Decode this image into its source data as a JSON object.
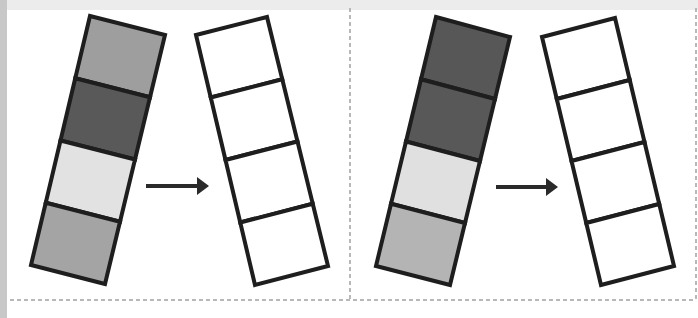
{
  "colors": {
    "background": "#ffffff",
    "outline": "#1e1e1e",
    "border_dash": "#b8b8b8",
    "top_band": "#ececec",
    "left_band": "#c8c8c8",
    "arrow": "#2a2a2a"
  },
  "panels": [
    {
      "name": "panel-left",
      "source_strip": {
        "corners": {
          "tl": [
            90,
            16
          ],
          "tr": [
            165,
            35
          ],
          "br": [
            105,
            284
          ],
          "bl": [
            31,
            265
          ]
        },
        "cells": [
          {
            "fill": "#9e9e9e",
            "label": "medium-gray"
          },
          {
            "fill": "#595959",
            "label": "dark-gray"
          },
          {
            "fill": "#e2e2e2",
            "label": "light-gray"
          },
          {
            "fill": "#a4a4a4",
            "label": "medium-gray"
          }
        ]
      },
      "arrow": {
        "x1": 146,
        "x2": 209,
        "y": 186
      },
      "target_strip": {
        "corners": {
          "tl": [
            196,
            35
          ],
          "tr": [
            267,
            17
          ],
          "br": [
            328,
            266
          ],
          "bl": [
            255,
            285
          ]
        },
        "cells": [
          {
            "fill": "#ffffff",
            "label": "empty"
          },
          {
            "fill": "#ffffff",
            "label": "empty"
          },
          {
            "fill": "#ffffff",
            "label": "empty"
          },
          {
            "fill": "#ffffff",
            "label": "empty"
          }
        ]
      }
    },
    {
      "name": "panel-right",
      "source_strip": {
        "corners": {
          "tl": [
            436,
            17
          ],
          "tr": [
            510,
            37
          ],
          "br": [
            450,
            285
          ],
          "bl": [
            376,
            266
          ]
        },
        "cells": [
          {
            "fill": "#575757",
            "label": "dark-gray"
          },
          {
            "fill": "#585858",
            "label": "dark-gray"
          },
          {
            "fill": "#e0e0e0",
            "label": "light-gray"
          },
          {
            "fill": "#b4b4b4",
            "label": "medium-light-gray"
          }
        ]
      },
      "arrow": {
        "x1": 496,
        "x2": 558,
        "y": 187
      },
      "target_strip": {
        "corners": {
          "tl": [
            542,
            37
          ],
          "tr": [
            615,
            18
          ],
          "br": [
            674,
            266
          ],
          "bl": [
            601,
            285
          ]
        },
        "cells": [
          {
            "fill": "#ffffff",
            "label": "empty"
          },
          {
            "fill": "#ffffff",
            "label": "empty"
          },
          {
            "fill": "#ffffff",
            "label": "empty"
          },
          {
            "fill": "#ffffff",
            "label": "empty"
          }
        ]
      }
    }
  ]
}
